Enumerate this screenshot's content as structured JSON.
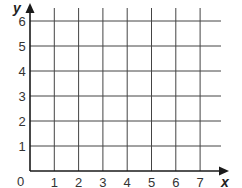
{
  "chart_data": {
    "type": "grid",
    "title": "",
    "xlabel": "x",
    "ylabel": "y",
    "xlim": [
      0,
      7
    ],
    "ylim": [
      0,
      6
    ],
    "x_ticks": [
      "1",
      "2",
      "3",
      "4",
      "5",
      "6",
      "7"
    ],
    "y_ticks": [
      "1",
      "2",
      "3",
      "4",
      "5",
      "6"
    ],
    "origin_label": "0",
    "grid": true,
    "points": []
  },
  "colors": {
    "axis": "#1a1a1a",
    "grid": "#444444",
    "text": "#333333"
  }
}
